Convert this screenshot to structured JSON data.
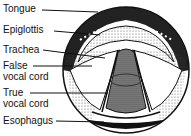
{
  "diagram": {
    "labels": [
      {
        "text": "Tongue",
        "y": 4
      },
      {
        "text": "Epiglottis",
        "y": 25
      },
      {
        "text": "Trachea",
        "y": 45
      },
      {
        "text": "False",
        "y": 61
      },
      {
        "text": "vocal cord",
        "y": 72
      },
      {
        "text": "True",
        "y": 88
      },
      {
        "text": "vocal cord",
        "y": 99
      },
      {
        "text": "Esophagus",
        "y": 116
      }
    ]
  }
}
